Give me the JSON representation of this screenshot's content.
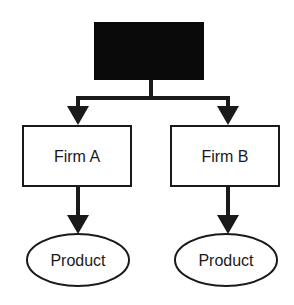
{
  "diagram": {
    "type": "hierarchy",
    "root": {
      "label": "",
      "fill": "#0a0a0a"
    },
    "firms": [
      {
        "label": "Firm A",
        "product": "Product"
      },
      {
        "label": "Firm B",
        "product": "Product"
      }
    ],
    "colors": {
      "stroke": "#1a1a1a",
      "background": "#ffffff"
    }
  }
}
